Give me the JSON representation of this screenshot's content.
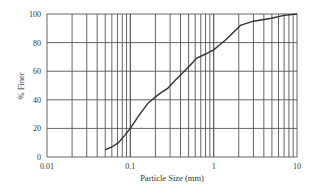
{
  "chart_data": {
    "type": "line",
    "title": "",
    "xlabel": "Particle Size (mm)",
    "ylabel": "% Finer",
    "xscale": "log",
    "xlim": [
      0.01,
      10
    ],
    "ylim": [
      0,
      100
    ],
    "x_ticks": [
      "0.01",
      "0.1",
      "1",
      "10"
    ],
    "y_ticks": [
      "0",
      "20",
      "40",
      "60",
      "80",
      "100"
    ],
    "grid": true,
    "legend": null,
    "series": [
      {
        "name": "Gradation curve",
        "x": [
          0.05,
          0.06,
          0.072,
          0.085,
          0.1,
          0.13,
          0.165,
          0.22,
          0.28,
          0.35,
          0.43,
          0.52,
          0.62,
          0.8,
          1.0,
          1.4,
          2.1,
          3.0,
          4.9,
          7.0,
          10
        ],
        "y": [
          5,
          7,
          10,
          15,
          20,
          30,
          38,
          44,
          48,
          54,
          59,
          64,
          69,
          72,
          75,
          82,
          92,
          95,
          97,
          99,
          100
        ]
      }
    ],
    "colors": {
      "line": "#333333",
      "grid": "#555555"
    }
  }
}
